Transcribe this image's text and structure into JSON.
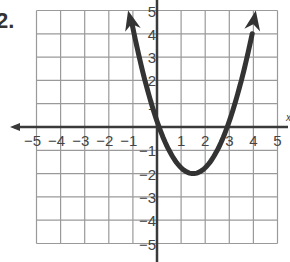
{
  "problem": {
    "number_label": "2."
  },
  "colors": {
    "grid": "#9a9a9a",
    "axis": "#3a3a3a",
    "curve": "#333333",
    "text": "#444444"
  },
  "chart_data": {
    "type": "line",
    "title": "",
    "xlabel": "x",
    "ylabel": "",
    "xlim": [
      -5,
      5
    ],
    "ylim": [
      -5,
      5
    ],
    "grid": true,
    "x_ticks": [
      -5,
      -4,
      -3,
      -2,
      -1,
      1,
      2,
      3,
      4,
      5
    ],
    "x_tick_labels": [
      "−5",
      "−4",
      "−3",
      "−2",
      "−1",
      "1",
      "2",
      "3",
      "4",
      "5"
    ],
    "y_ticks": [
      5,
      4,
      3,
      2,
      1,
      -1,
      -2,
      -3,
      -4,
      -5
    ],
    "y_tick_labels": [
      "5",
      "4",
      "3",
      "2",
      "1",
      "−1",
      "−2",
      "−3",
      "−4",
      "−5"
    ],
    "series": [
      {
        "name": "parabola",
        "description": "Upward-opening parabola with arrowheads at both ends",
        "equation_estimate": "y = (x - 1.5)^2 - 2",
        "vertex": [
          1.5,
          -2
        ],
        "x_intercepts": [
          0.1,
          2.9
        ],
        "y_intercept": 0.25,
        "endpoints": [
          [
            -1.2,
            5
          ],
          [
            4.1,
            5
          ]
        ],
        "x": [
          -1.2,
          -1,
          -0.5,
          0,
          0.5,
          1,
          1.5,
          2,
          2.5,
          3,
          3.5,
          4,
          4.1
        ],
        "y": [
          5.29,
          4.25,
          2.0,
          0.25,
          -1.0,
          -1.75,
          -2.0,
          -1.75,
          -1.0,
          0.25,
          2.0,
          4.25,
          4.76
        ]
      }
    ],
    "legend": null
  },
  "layout": {
    "origin_px": [
      157,
      127
    ],
    "unit_px_x": 24.1,
    "unit_px_y": 23.3
  }
}
